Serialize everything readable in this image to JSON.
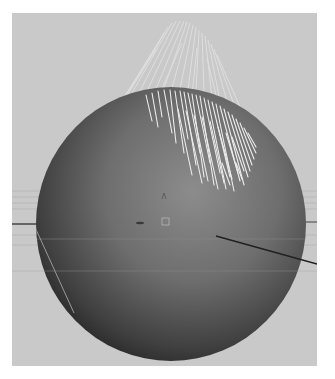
{
  "viewport": {
    "background_color": "#c9c9c9",
    "scene_object": "sphere-with-hair",
    "sphere": {
      "center_x": 159,
      "center_y": 211,
      "radius": 135,
      "highlight_color": "#8a8a8a",
      "shadow_color": "#1e1e1e"
    },
    "hair_color": "#ececec",
    "grid_line_color": "#b5b5b5",
    "axis_line_color": "#2a2a2a",
    "icons": [
      {
        "name": "pivot-marker-icon"
      },
      {
        "name": "manipulator-square-icon"
      },
      {
        "name": "up-axis-caret-icon"
      }
    ]
  }
}
